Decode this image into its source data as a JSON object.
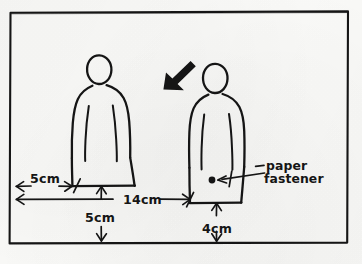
{
  "diagram": {
    "medium": "pen on paper",
    "ink_color": "#151515",
    "paper_color": "#fbfbf9",
    "frame": {
      "name": "hand-drawn rectangular border",
      "x": 9,
      "y": 11,
      "width": 339,
      "height": 232
    }
  },
  "figures": [
    {
      "name": "left-figure",
      "description": "hand-drawn standing person in long robe",
      "head_center": {
        "x": 99,
        "y": 70
      },
      "hem": {
        "left_x": 72,
        "right_x": 135,
        "y": 186
      },
      "has_fastener": false
    },
    {
      "name": "right-figure",
      "description": "hand-drawn standing person in long robe with paper fastener dot",
      "head_center": {
        "x": 215,
        "y": 78
      },
      "hem": {
        "left_x": 190,
        "right_x": 241,
        "y": 203
      },
      "has_fastener": true,
      "fastener_dot": {
        "x": 212,
        "y": 180,
        "radius": 3.4
      }
    }
  ],
  "pointer": {
    "name": "bold-arrow-cursor",
    "label": "bold arrow pointing down-left at right figure",
    "tip": {
      "x": 164,
      "y": 89
    },
    "tail": {
      "x": 192,
      "y": 63
    }
  },
  "dimensions": [
    {
      "id": "left-offset",
      "label": "5cm",
      "orientation": "horizontal",
      "description": "distance from left frame edge to left figure hem",
      "from": {
        "x": 16,
        "y": 186
      },
      "to": {
        "x": 72,
        "y": 186
      },
      "text_pos": {
        "x": 30,
        "y": 183
      }
    },
    {
      "id": "left-height",
      "label": "5cm",
      "orientation": "vertical",
      "description": "distance from left figure hem down to bottom frame edge",
      "from": {
        "x": 101,
        "y": 186
      },
      "to": {
        "x": 101,
        "y": 240
      },
      "text_pos": {
        "x": 85,
        "y": 222
      }
    },
    {
      "id": "span-between",
      "label": "14cm",
      "orientation": "horizontal",
      "description": "distance from left frame edge to right figure hem",
      "from": {
        "x": 16,
        "y": 199
      },
      "to": {
        "x": 190,
        "y": 199
      },
      "text_pos": {
        "x": 123,
        "y": 204
      }
    },
    {
      "id": "right-height",
      "label": "4cm",
      "orientation": "vertical",
      "description": "distance from right figure hem down to bottom frame edge",
      "from": {
        "x": 216,
        "y": 203
      },
      "to": {
        "x": 216,
        "y": 240
      },
      "text_pos": {
        "x": 202,
        "y": 233
      }
    }
  ],
  "callout": {
    "name": "paper-fastener-callout",
    "line1": "paper",
    "line2": "fastener",
    "text_pos": {
      "x": 268,
      "y": 172
    },
    "leader_from": {
      "x": 264,
      "y": 173
    },
    "leader_to": {
      "x": 218,
      "y": 180
    }
  }
}
